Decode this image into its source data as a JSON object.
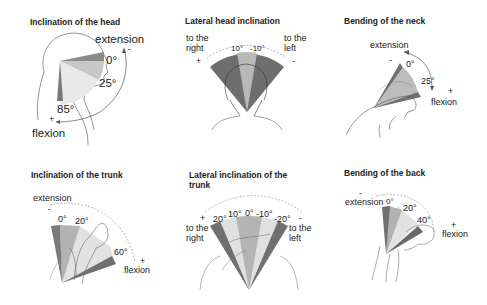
{
  "panels": [
    {
      "id": "inclination-head",
      "title": "Inclination of the head",
      "labels": {
        "extension": "extension",
        "minus": "-",
        "deg0": "0°",
        "deg25": "25°",
        "deg85": "85°",
        "plus": "+",
        "flexion": "flexion"
      }
    },
    {
      "id": "lateral-head-inclination",
      "title": "Lateral head inclination",
      "labels": {
        "right_line1": "to the",
        "right_line2": "right",
        "plus": "+",
        "deg10": "10°",
        "degm10": "-10°",
        "left_line1": "to the",
        "left_line2": "left",
        "minus": "-"
      }
    },
    {
      "id": "bending-neck",
      "title": "Bending of the neck",
      "labels": {
        "extension": "extension",
        "minus": "-",
        "deg0": "0°",
        "deg25": "25°",
        "plus": "+",
        "flexion": "flexion"
      }
    },
    {
      "id": "inclination-trunk",
      "title": "Inclination of the trunk",
      "labels": {
        "extension": "extension",
        "minus": "-",
        "deg0": "0°",
        "deg20": "20°",
        "deg60": "60°",
        "plus": "+",
        "flexion": "flexion"
      }
    },
    {
      "id": "lateral-inclination-trunk",
      "title_line1": "Lateral inclination of the",
      "title_line2": "trunk",
      "labels": {
        "plus": "+",
        "right_line1": "to the",
        "right_line2": "right",
        "deg20": "20°",
        "deg10": "10°",
        "deg0": "0°",
        "degm10": "-10°",
        "degm20": "-20°",
        "minus": "-",
        "left_line1": "to the",
        "left_line2": "left"
      }
    },
    {
      "id": "bending-back",
      "title": "Bending of the back",
      "labels": {
        "minus": "-",
        "extension": "extension",
        "deg0": "0°",
        "deg20": "20°",
        "deg40": "40°",
        "plus": "+",
        "flexion": "flexion"
      }
    }
  ],
  "colors": {
    "dark": "#6e6e6e",
    "mid": "#a8a8a8",
    "light": "#d4d4d4",
    "lighter": "#e8e8e8",
    "line": "#555555"
  }
}
